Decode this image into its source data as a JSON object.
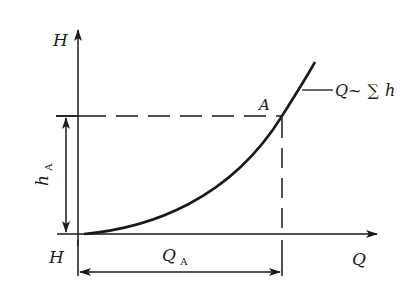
{
  "diagram": {
    "type": "pipeline characteristic curve",
    "axes": {
      "y_label": "H",
      "x_label": "Q",
      "origin_label": "H"
    },
    "curve": {
      "label_main": "Q~",
      "label_sum": "∑",
      "label_var": "h"
    },
    "point": {
      "label": "A"
    },
    "dimensions": {
      "vertical_label": "h",
      "vertical_sub": "A",
      "horizontal_label": "Q",
      "horizontal_sub": "A"
    },
    "colors": {
      "ink": "#1a1a1a",
      "background": "#ffffff"
    }
  }
}
